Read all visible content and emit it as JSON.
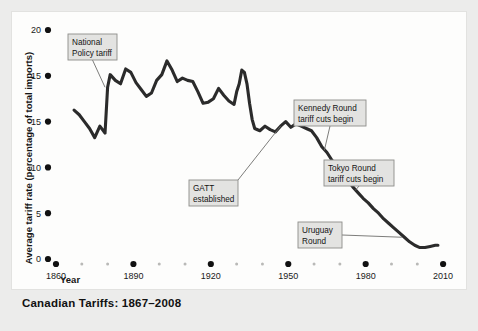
{
  "caption": "Canadian Tariffs: 1867–2008",
  "colors": {
    "page_background": "#ececeb",
    "panel_background": "#fdfdfc",
    "line": "#2b2b2b",
    "tick_dot": "#111111",
    "minor_dot": "#b9b9b7",
    "callout_fill": "#e3e3e1",
    "callout_border": "#8d8d8b",
    "leader_line": "#6e6e6c"
  },
  "chart_data": {
    "type": "line",
    "title": "Canadian Tariffs: 1867–2008",
    "xlabel": "Year",
    "ylabel": "Average tariff rate (percentage of total imports)",
    "xlim": [
      1860,
      2015
    ],
    "ylim": [
      0,
      20
    ],
    "grid": false,
    "legend": "none",
    "xticks": [
      1860,
      1890,
      1920,
      1950,
      1980,
      2010
    ],
    "xticklabels": [
      "1860",
      "1890",
      "1920",
      "1950",
      "1980",
      "2010"
    ],
    "yticks": [
      0,
      5,
      10,
      15,
      15,
      20
    ],
    "yticklabels": [
      "0",
      "5",
      "10",
      "15",
      "15",
      "20"
    ],
    "series": [
      {
        "name": "Average tariff rate",
        "x": [
          1867,
          1869,
          1871,
          1873,
          1875,
          1877,
          1879,
          1880,
          1881,
          1883,
          1885,
          1887,
          1889,
          1891,
          1893,
          1895,
          1897,
          1899,
          1901,
          1903,
          1905,
          1907,
          1909,
          1911,
          1913,
          1915,
          1917,
          1919,
          1921,
          1923,
          1925,
          1927,
          1929,
          1930,
          1931,
          1932,
          1933,
          1934,
          1935,
          1936,
          1937,
          1939,
          1941,
          1943,
          1945,
          1947,
          1949,
          1951,
          1953,
          1955,
          1957,
          1959,
          1961,
          1963,
          1965,
          1967,
          1969,
          1971,
          1973,
          1975,
          1977,
          1979,
          1981,
          1983,
          1985,
          1987,
          1989,
          1991,
          1993,
          1995,
          1997,
          1999,
          2001,
          2003,
          2005,
          2007,
          2008
        ],
        "y": [
          13.0,
          12.6,
          12.0,
          11.4,
          10.6,
          11.6,
          11.0,
          15.0,
          16.1,
          15.6,
          15.3,
          16.6,
          16.3,
          15.4,
          14.8,
          14.2,
          14.5,
          15.6,
          16.1,
          17.3,
          16.5,
          15.5,
          15.8,
          15.6,
          15.5,
          14.6,
          13.6,
          13.7,
          14.0,
          14.9,
          14.3,
          13.8,
          13.5,
          14.6,
          15.3,
          16.5,
          16.3,
          15.3,
          13.6,
          12.2,
          11.4,
          11.2,
          11.6,
          11.3,
          11.1,
          11.6,
          12.0,
          11.5,
          11.8,
          11.6,
          11.4,
          11.2,
          10.6,
          9.8,
          9.3,
          8.6,
          8.0,
          7.4,
          6.9,
          6.3,
          5.8,
          5.3,
          4.9,
          4.4,
          4.0,
          3.5,
          3.1,
          2.7,
          2.3,
          1.9,
          1.5,
          1.2,
          1.0,
          1.0,
          1.1,
          1.2,
          1.2
        ]
      }
    ],
    "annotations": [
      {
        "label_line1": "National",
        "label_line2": "Policy tariff",
        "year": 1879,
        "value": 15.0
      },
      {
        "label_line1": "GATT",
        "label_line2": "established",
        "year": 1947,
        "value": 11.6
      },
      {
        "label_line1": "Kennedy Round",
        "label_line2": "tariff cuts begin",
        "year": 1964,
        "value": 9.5
      },
      {
        "label_line1": "Tokyo Round",
        "label_line2": "tariff cuts begin",
        "year": 1976,
        "value": 6.0
      },
      {
        "label_line1": "Uruguay",
        "label_line2": "Round",
        "year": 1994,
        "value": 1.9
      }
    ]
  }
}
